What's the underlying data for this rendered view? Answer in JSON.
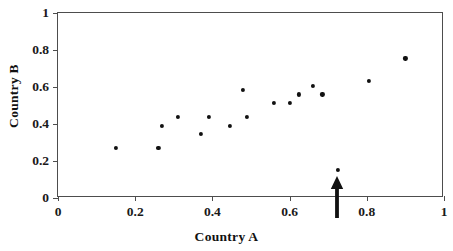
{
  "chart_data": {
    "type": "scatter",
    "title": "",
    "xlabel": "Country A",
    "ylabel": "Country B",
    "xlim": [
      0,
      1
    ],
    "ylim": [
      0,
      1
    ],
    "grid": false,
    "legend": null,
    "xticks": [
      "0",
      "0.2",
      "0.4",
      "0.6",
      "0.8",
      "1"
    ],
    "xtick_values": [
      0,
      0.2,
      0.4,
      0.6,
      0.8,
      1
    ],
    "yticks": [
      "0",
      "0.2",
      "0.4",
      "0.6",
      "0.8",
      "1"
    ],
    "ytick_values": [
      0,
      0.2,
      0.4,
      0.6,
      0.8,
      1
    ],
    "series": [
      {
        "name": "countries",
        "marker": "filled-circle",
        "color": "#111111",
        "points": [
          {
            "x": 0.15,
            "y": 0.27
          },
          {
            "x": 0.26,
            "y": 0.27
          },
          {
            "x": 0.27,
            "y": 0.39
          },
          {
            "x": 0.31,
            "y": 0.44
          },
          {
            "x": 0.37,
            "y": 0.345
          },
          {
            "x": 0.39,
            "y": 0.44
          },
          {
            "x": 0.445,
            "y": 0.39
          },
          {
            "x": 0.48,
            "y": 0.585
          },
          {
            "x": 0.49,
            "y": 0.44
          },
          {
            "x": 0.56,
            "y": 0.515
          },
          {
            "x": 0.6,
            "y": 0.515
          },
          {
            "x": 0.625,
            "y": 0.56
          },
          {
            "x": 0.66,
            "y": 0.605
          },
          {
            "x": 0.685,
            "y": 0.56
          },
          {
            "x": 0.725,
            "y": 0.15
          },
          {
            "x": 0.805,
            "y": 0.635
          },
          {
            "x": 0.9,
            "y": 0.755
          }
        ]
      }
    ],
    "annotations": [
      {
        "type": "arrow",
        "direction": "up",
        "x": 0.725,
        "color": "#111111",
        "points_to": "outlier point at (0.725, 0.15)"
      }
    ]
  },
  "colors": {
    "marker": "#111111",
    "axis": "#4d4d4d",
    "text": "#111111",
    "background": "#ffffff"
  }
}
